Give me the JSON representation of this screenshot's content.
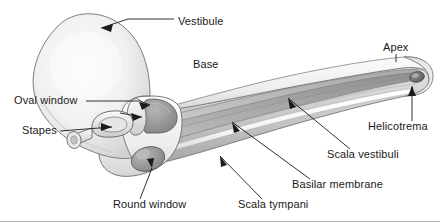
{
  "figure": {
    "background_color": "#ffffff",
    "text_color": "#1b1b1b",
    "width": 440,
    "height": 222
  },
  "labels": [
    {
      "id": "vestibule",
      "text": "Vestibule",
      "x": 178,
      "y": 22,
      "anchor": "start"
    },
    {
      "id": "base",
      "text": "Base",
      "x": 193,
      "y": 65,
      "anchor": "start"
    },
    {
      "id": "apex",
      "text": "Apex",
      "x": 383,
      "y": 48,
      "anchor": "start"
    },
    {
      "id": "oval-window",
      "text": "Oval window",
      "x": 14,
      "y": 104,
      "anchor": "start"
    },
    {
      "id": "stapes",
      "text": "Stapes",
      "x": 22,
      "y": 134,
      "anchor": "start"
    },
    {
      "id": "helicotrema",
      "text": "Helicotrema",
      "x": 368,
      "y": 127,
      "anchor": "start"
    },
    {
      "id": "scala-vestibuli",
      "text": "Scala vestibuli",
      "x": 327,
      "y": 155,
      "anchor": "start"
    },
    {
      "id": "basilar-membrane",
      "text": "Basilar membrane",
      "x": 292,
      "y": 185,
      "anchor": "start"
    },
    {
      "id": "round-window",
      "text": "Round window",
      "x": 113,
      "y": 205,
      "anchor": "start"
    },
    {
      "id": "scala-tympani",
      "text": "Scala tympani",
      "x": 238,
      "y": 205,
      "anchor": "start"
    }
  ],
  "structures": [
    {
      "id": "vestibule-bulb",
      "name": "vestibule"
    },
    {
      "id": "cochlear-body",
      "name": "uncoiled-cochlear-duct"
    },
    {
      "id": "basilar-membrane",
      "name": "basilar-membrane-plate"
    },
    {
      "id": "scala-vestibuli",
      "name": "upper-chamber"
    },
    {
      "id": "scala-tympani",
      "name": "lower-chamber"
    },
    {
      "id": "helicotrema-hole",
      "name": "apical-connecting-opening"
    },
    {
      "id": "oval-window-hole",
      "name": "oval-window-membrane"
    },
    {
      "id": "round-window-hole",
      "name": "round-window-membrane"
    },
    {
      "id": "stapes-bone",
      "name": "stapes-stirrup-bone"
    }
  ],
  "colors": {
    "outline": "#5d5d5d",
    "body_light": "#f2f2f2",
    "body_mid": "#d8d8d8",
    "body_dark": "#9a9a9a",
    "window_fill": "#9e9e9e",
    "leader": "#1b1b1b"
  }
}
